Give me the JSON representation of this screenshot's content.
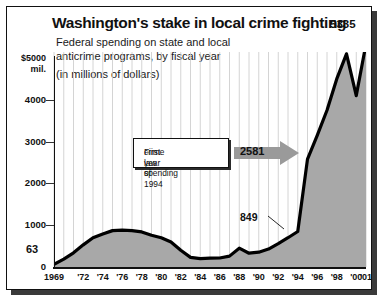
{
  "header": {
    "title": "Washington's stake in local crime fighting",
    "subtitle_line1": "Federal spending on state and local",
    "subtitle_line2": "anticrime programs, by fiscal year",
    "subtitle_line3": "(in millions of dollars)"
  },
  "annotation": {
    "box_line1": "First year of 1994",
    "box_line2": "crime law spending",
    "arrow_value": "2581"
  },
  "callouts": {
    "start": "63",
    "pre_spike": "849",
    "peak": "5335"
  },
  "axis": {
    "y_top_label_line1": "$5000",
    "y_top_label_line2": "mil.",
    "y_ticks": [
      "4000",
      "3000",
      "2000",
      "1000",
      "0"
    ]
  },
  "colors": {
    "fill": "#a8a8a8",
    "line": "#000000",
    "frame": "#111111",
    "arrow": "#9a9a9a",
    "background": "#ffffff"
  },
  "chart_data": {
    "type": "area",
    "title": "Washington's stake in local crime fighting",
    "subtitle": "Federal spending on state and local anticrime programs, by fiscal year (in millions of dollars)",
    "xlabel": "",
    "ylabel": "$ millions",
    "ylim": [
      0,
      5500
    ],
    "xlim": [
      1969,
      2001
    ],
    "grid": "vertical-yearly",
    "legend": "none",
    "ytick_values": [
      0,
      1000,
      2000,
      3000,
      4000,
      5000
    ],
    "ytick_labels": [
      "0",
      "1000",
      "2000",
      "3000",
      "4000",
      "$5000 mil."
    ],
    "xtick_labels": [
      "1969",
      "'72",
      "'74",
      "'76",
      "'78",
      "'80",
      "'82",
      "'84",
      "'86",
      "'88",
      "'90",
      "'92",
      "'94",
      "'96",
      "'98",
      "'00",
      "'01"
    ],
    "xtick_years": [
      1969,
      1972,
      1974,
      1976,
      1978,
      1980,
      1982,
      1984,
      1986,
      1988,
      1990,
      1992,
      1994,
      1996,
      1998,
      2000,
      2001
    ],
    "x": [
      1969,
      1970,
      1971,
      1972,
      1973,
      1974,
      1975,
      1976,
      1977,
      1978,
      1979,
      1980,
      1981,
      1982,
      1983,
      1984,
      1985,
      1986,
      1987,
      1988,
      1989,
      1990,
      1991,
      1992,
      1993,
      1994,
      1995,
      1996,
      1997,
      1998,
      1999,
      2000,
      2001
    ],
    "values": [
      63,
      190,
      340,
      530,
      700,
      790,
      870,
      880,
      870,
      840,
      760,
      700,
      600,
      400,
      230,
      200,
      210,
      215,
      260,
      450,
      330,
      355,
      430,
      560,
      700,
      849,
      2581,
      3150,
      3750,
      4500,
      5100,
      4100,
      5335
    ],
    "annotations": [
      {
        "label": "63",
        "year": 1969,
        "value": 63
      },
      {
        "label": "849",
        "year": 1994,
        "value": 849
      },
      {
        "label": "2581",
        "year": 1995,
        "value": 2581,
        "note": "First year of 1994 crime law spending"
      },
      {
        "label": "5335",
        "year": 2001,
        "value": 5335
      }
    ]
  }
}
